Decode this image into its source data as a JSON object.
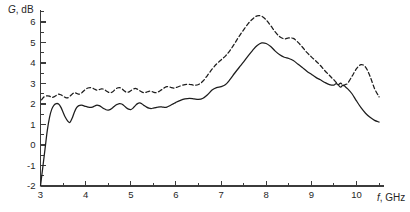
{
  "chart_data": {
    "type": "line",
    "title": "",
    "subtitle": "",
    "xlabel": "f, GHz",
    "ylabel": "G, dB",
    "xlabel_italic_part": "f",
    "xlabel_rest": ", GHz",
    "ylabel_italic_part": "G",
    "ylabel_rest": ", dB",
    "xlim": [
      3,
      10.6
    ],
    "ylim": [
      -2,
      6.6
    ],
    "grid": false,
    "legend": "none",
    "x_ticks_major": [
      3,
      4,
      5,
      6,
      7,
      8,
      9,
      10
    ],
    "x_tick_labels": [
      "3",
      "4",
      "5",
      "6",
      "7",
      "8",
      "9",
      "10"
    ],
    "x_ticks_minor": [
      3.5,
      4.5,
      5.5,
      6.5,
      7.5,
      8.5,
      9.5,
      10.5
    ],
    "y_ticks_major": [
      -2,
      -1,
      0,
      1,
      2,
      3,
      4,
      5,
      6
    ],
    "y_tick_labels": [
      "-2",
      "-1",
      "0",
      "1",
      "2",
      "3",
      "4",
      "5",
      "6"
    ],
    "y_ticks_minor": [
      -1.5,
      -0.5,
      0.5,
      1.5,
      2.5,
      3.5,
      4.5,
      5.5,
      6.5
    ],
    "series": [
      {
        "name": "solid-curve",
        "style": "solid",
        "color": "#1d1d1d",
        "x": [
          3.0,
          3.05,
          3.1,
          3.15,
          3.2,
          3.25,
          3.3,
          3.35,
          3.4,
          3.45,
          3.5,
          3.55,
          3.6,
          3.65,
          3.7,
          3.75,
          3.8,
          3.85,
          3.9,
          3.95,
          4.0,
          4.05,
          4.1,
          4.15,
          4.2,
          4.25,
          4.3,
          4.35,
          4.4,
          4.45,
          4.5,
          4.55,
          4.6,
          4.65,
          4.7,
          4.75,
          4.8,
          4.85,
          4.9,
          4.95,
          5.0,
          5.05,
          5.1,
          5.15,
          5.2,
          5.25,
          5.3,
          5.35,
          5.4,
          5.45,
          5.5,
          5.55,
          5.6,
          5.65,
          5.7,
          5.75,
          5.8,
          5.85,
          5.9,
          5.95,
          6.0,
          6.1,
          6.2,
          6.3,
          6.4,
          6.5,
          6.6,
          6.7,
          6.8,
          6.9,
          7.0,
          7.1,
          7.2,
          7.3,
          7.4,
          7.5,
          7.6,
          7.7,
          7.8,
          7.9,
          8.0,
          8.1,
          8.2,
          8.3,
          8.4,
          8.5,
          8.6,
          8.7,
          8.8,
          8.9,
          9.0,
          9.1,
          9.2,
          9.3,
          9.4,
          9.5,
          9.55,
          9.6,
          9.65,
          9.7,
          9.75,
          9.8,
          9.9,
          10.0,
          10.1,
          10.2,
          10.3,
          10.4,
          10.5
        ],
        "y": [
          -2.0,
          -1.1,
          -0.2,
          0.7,
          1.35,
          1.75,
          1.95,
          2.02,
          2.0,
          1.85,
          1.6,
          1.35,
          1.18,
          1.1,
          1.3,
          1.6,
          1.82,
          1.92,
          1.95,
          1.92,
          1.88,
          1.85,
          1.83,
          1.85,
          1.9,
          1.95,
          1.92,
          1.85,
          1.78,
          1.72,
          1.7,
          1.74,
          1.82,
          1.92,
          1.98,
          2.02,
          2.0,
          1.92,
          1.82,
          1.75,
          1.73,
          1.8,
          1.92,
          2.02,
          2.05,
          2.0,
          1.92,
          1.85,
          1.8,
          1.78,
          1.8,
          1.82,
          1.85,
          1.86,
          1.85,
          1.84,
          1.85,
          1.9,
          1.96,
          2.02,
          2.08,
          2.18,
          2.25,
          2.28,
          2.25,
          2.22,
          2.28,
          2.45,
          2.68,
          2.8,
          2.85,
          2.95,
          3.2,
          3.5,
          3.78,
          4.05,
          4.35,
          4.62,
          4.85,
          4.98,
          4.95,
          4.8,
          4.58,
          4.4,
          4.28,
          4.22,
          4.12,
          3.95,
          3.78,
          3.6,
          3.45,
          3.3,
          3.18,
          3.05,
          2.95,
          2.92,
          3.0,
          2.92,
          2.82,
          2.92,
          2.85,
          2.75,
          2.5,
          2.15,
          1.82,
          1.55,
          1.35,
          1.2,
          1.12
        ],
        "notes": "Rises from -2 dB at 3 GHz, dip to 1.1 dB at 3.65 GHz, plateau near 1.8-2.0 dB, peak 5.0 dB at 7.9 GHz, falls sharply after 9.8 GHz to 1.1 dB"
      },
      {
        "name": "dashed-curve",
        "style": "dashed",
        "color": "#1d1d1d",
        "x": [
          3.02,
          3.08,
          3.15,
          3.2,
          3.25,
          3.3,
          3.35,
          3.4,
          3.45,
          3.5,
          3.55,
          3.6,
          3.65,
          3.7,
          3.75,
          3.8,
          3.85,
          3.9,
          3.95,
          4.0,
          4.05,
          4.1,
          4.15,
          4.2,
          4.25,
          4.3,
          4.35,
          4.4,
          4.45,
          4.5,
          4.55,
          4.6,
          4.65,
          4.7,
          4.75,
          4.8,
          4.85,
          4.9,
          4.95,
          5.0,
          5.05,
          5.1,
          5.15,
          5.2,
          5.25,
          5.3,
          5.35,
          5.4,
          5.45,
          5.5,
          5.55,
          5.6,
          5.65,
          5.7,
          5.75,
          5.8,
          5.85,
          5.9,
          5.95,
          6.0,
          6.1,
          6.2,
          6.3,
          6.4,
          6.5,
          6.6,
          6.7,
          6.8,
          6.9,
          7.0,
          7.1,
          7.2,
          7.3,
          7.4,
          7.5,
          7.6,
          7.7,
          7.8,
          7.9,
          8.0,
          8.1,
          8.2,
          8.3,
          8.4,
          8.5,
          8.6,
          8.7,
          8.8,
          8.9,
          9.0,
          9.1,
          9.2,
          9.3,
          9.4,
          9.45,
          9.5,
          9.55,
          9.6,
          9.65,
          9.7,
          9.75,
          9.8,
          9.9,
          10.0,
          10.1,
          10.2,
          10.3,
          10.4,
          10.5
        ],
        "y": [
          2.2,
          2.35,
          2.4,
          2.38,
          2.32,
          2.35,
          2.42,
          2.48,
          2.45,
          2.38,
          2.32,
          2.3,
          2.38,
          2.48,
          2.55,
          2.52,
          2.48,
          2.52,
          2.62,
          2.72,
          2.78,
          2.8,
          2.78,
          2.72,
          2.68,
          2.7,
          2.74,
          2.72,
          2.65,
          2.58,
          2.55,
          2.6,
          2.7,
          2.78,
          2.8,
          2.75,
          2.65,
          2.58,
          2.58,
          2.65,
          2.72,
          2.76,
          2.72,
          2.65,
          2.58,
          2.55,
          2.58,
          2.62,
          2.62,
          2.58,
          2.55,
          2.58,
          2.65,
          2.72,
          2.8,
          2.85,
          2.84,
          2.8,
          2.78,
          2.8,
          2.88,
          2.95,
          2.96,
          2.92,
          2.95,
          3.12,
          3.4,
          3.7,
          3.95,
          4.15,
          4.35,
          4.62,
          4.95,
          5.3,
          5.62,
          5.92,
          6.15,
          6.3,
          6.28,
          6.1,
          5.82,
          5.52,
          5.28,
          5.18,
          5.22,
          5.2,
          5.02,
          4.78,
          4.52,
          4.3,
          4.1,
          3.88,
          3.62,
          3.4,
          3.28,
          3.18,
          3.05,
          2.95,
          3.02,
          2.9,
          2.95,
          3.0,
          3.35,
          3.72,
          3.92,
          3.8,
          3.35,
          2.75,
          2.35
        ],
        "notes": "Upper trace, oscillates 2.2-2.9 dB from 3 to 6.5 GHz, peak 6.3 dB at 7.8 GHz, secondary shoulder near 8.45 GHz, local bump 3.9 dB at 10.1 GHz, ends 2.35 dB"
      }
    ]
  }
}
